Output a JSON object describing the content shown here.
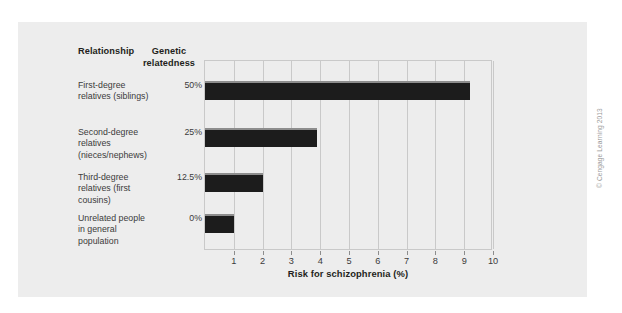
{
  "figure": {
    "credit": "© Cengage Learning 2013",
    "panel_color": "#ededed",
    "bar_color": "#1c1c1c",
    "grid_color": "#c9c9c9"
  },
  "table": {
    "headers": {
      "relationship": "Relationship",
      "genetic_relatedness": "Genetic relatedness"
    },
    "rows": [
      {
        "name": "First-degree relatives (siblings)",
        "genetic_relatedness": "50%"
      },
      {
        "name": "Second-degree relatives (nieces/nephews)",
        "genetic_relatedness": "25%"
      },
      {
        "name": "Third-degree relatives (first cousins)",
        "genetic_relatedness": "12.5%"
      },
      {
        "name": "Unrelated people in general population",
        "genetic_relatedness": "0%"
      }
    ]
  },
  "chart_data": {
    "type": "bar",
    "orientation": "horizontal",
    "title": "",
    "xlabel": "Risk for schizophrenia (%)",
    "ylabel": "",
    "categories": [
      "First-degree relatives (siblings)",
      "Second-degree relatives (nieces/nephews)",
      "Third-degree relatives (first cousins)",
      "Unrelated people in general population"
    ],
    "values": [
      9.2,
      3.9,
      2.0,
      1.0
    ],
    "series": [
      {
        "name": "Risk for schizophrenia (%)",
        "values": [
          9.2,
          3.9,
          2.0,
          1.0
        ]
      }
    ],
    "secondary_labels": {
      "name": "Genetic relatedness",
      "values": [
        "50%",
        "25%",
        "12.5%",
        "0%"
      ]
    },
    "xlim": [
      0,
      10
    ],
    "xticks": [
      1,
      2,
      3,
      4,
      5,
      6,
      7,
      8,
      9,
      10
    ],
    "xticklabels": [
      "1",
      "2",
      "3",
      "4",
      "5",
      "6",
      "7",
      "8",
      "9",
      "10"
    ],
    "grid": "vertical",
    "legend": "none"
  }
}
